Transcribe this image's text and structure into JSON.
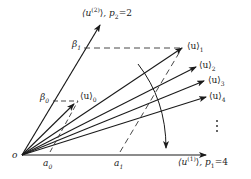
{
  "diagram": {
    "origin_label": "o",
    "axes": {
      "u1": {
        "label": "⟨u",
        "sup": "(1)",
        "close": "⟩",
        "param": ", p",
        "param_sub": "1",
        "value": "=4"
      },
      "u2": {
        "label": "⟨u",
        "sup": "(2)",
        "close": "⟩",
        "param": ", p",
        "param_sub": "2",
        "value": "=2"
      }
    },
    "beta_labels": [
      {
        "sym": "β",
        "sub": "0"
      },
      {
        "sym": "β",
        "sub": "1"
      }
    ],
    "a_labels": [
      {
        "sym": "a",
        "sub": "0"
      },
      {
        "sym": "a",
        "sub": "1"
      }
    ],
    "vectors": [
      {
        "sym": "⟨u⟩",
        "sub": "0"
      },
      {
        "sym": "⟨u⟩",
        "sub": "1"
      },
      {
        "sym": "⟨u⟩",
        "sub": "2"
      },
      {
        "sym": "⟨u⟩",
        "sub": "3"
      },
      {
        "sym": "⟨u⟩",
        "sub": "4"
      }
    ],
    "continuation": "⋮",
    "colors": {
      "line": "#1a1a1a",
      "dashed": "#333333",
      "background": "#ffffff"
    }
  }
}
